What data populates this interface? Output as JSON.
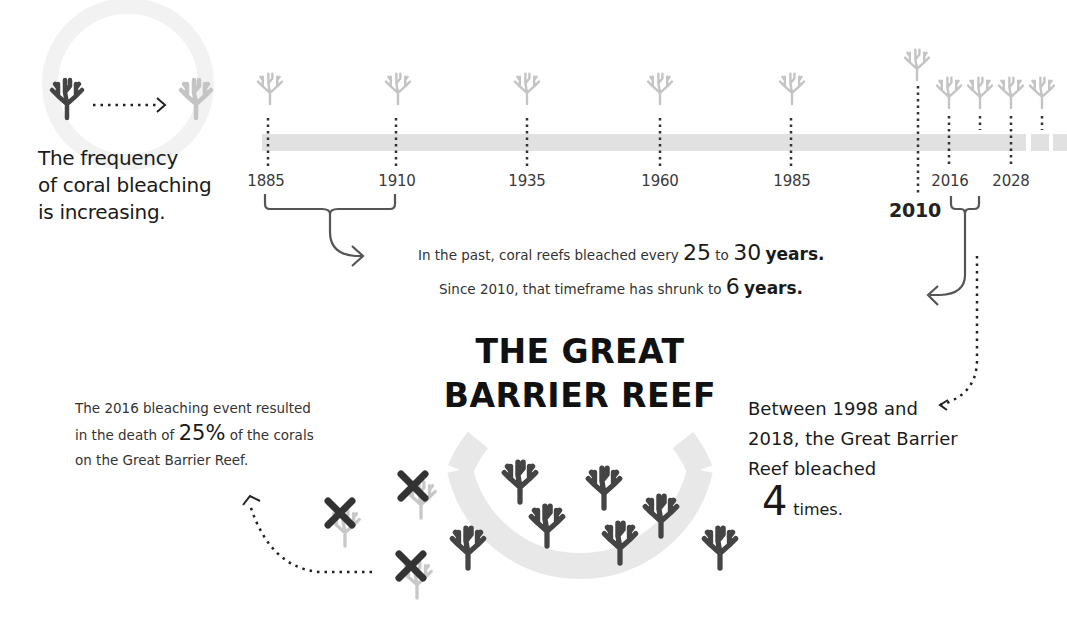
{
  "intro": {
    "lines": [
      "The frequency",
      "of coral bleaching",
      "is increasing."
    ]
  },
  "timeline": {
    "ticks": [
      {
        "year": "1885",
        "x": 266
      },
      {
        "year": "1910",
        "x": 397
      },
      {
        "year": "1935",
        "x": 527
      },
      {
        "year": "1960",
        "x": 660
      },
      {
        "year": "1985",
        "x": 792
      },
      {
        "year": "2016",
        "x": 950
      },
      {
        "year": "2028",
        "x": 1011
      }
    ],
    "highlight_year": "2010",
    "colors": {
      "bar": "#e1e1e1",
      "healthy_coral": "#444444",
      "bleached_coral": "#c4c4c4",
      "dead_mark": "#333333"
    }
  },
  "message": {
    "line1_prefix": "In the past, coral reefs bleached every",
    "line1_num1": "25",
    "line1_mid": "to",
    "line1_num2": "30",
    "line1_suffix": "years.",
    "line2_prefix": "Since 2010, that timeframe has shrunk to",
    "line2_num": "6",
    "line2_suffix": "years."
  },
  "title": {
    "line1": "THE GREAT",
    "line2": "BARRIER REEF"
  },
  "left_note": {
    "line1": "The 2016 bleaching event resulted",
    "line2_prefix": "in the death of",
    "line2_num": "25%",
    "line2_suffix": "of the corals",
    "line3": "on the Great Barrier Reef."
  },
  "right_note": {
    "line1": "Between 1998 and",
    "line2": "2018, the Great Barrier",
    "line3": "Reef bleached",
    "count": "4",
    "count_suffix": "times."
  }
}
